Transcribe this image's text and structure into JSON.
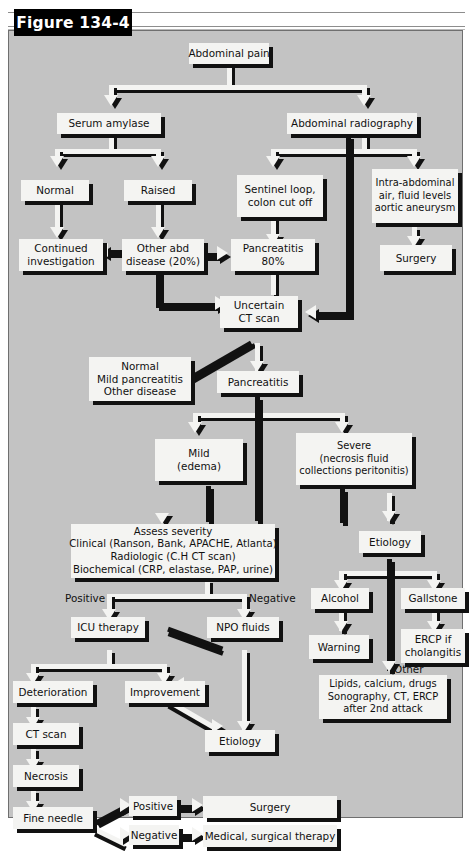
{
  "figure": {
    "banner_label": "Figure 134-4",
    "panel_background": "#c3c3c3",
    "box_fill": "#f4f4f2",
    "shadow_color": "#111111"
  },
  "diagram": {
    "type": "flowchart",
    "title": "Figure 134-4",
    "topic": "Diagnostic and management algorithm for abdominal pain and acute pancreatitis",
    "nodes": [
      {
        "id": "abdominal-pain",
        "label": "Abdominal pain"
      },
      {
        "id": "serum-amylase",
        "label": "Serum amylase"
      },
      {
        "id": "abdominal-radiography",
        "label": "Abdominal radiography"
      },
      {
        "id": "normal",
        "label": "Normal"
      },
      {
        "id": "raised",
        "label": "Raised"
      },
      {
        "id": "sentinel-loop",
        "label": "Sentinel loop,\ncolon cut off"
      },
      {
        "id": "intra-abdominal-air",
        "label": "Intra-abdominal\nair, fluid levels\naortic aneurysm"
      },
      {
        "id": "continued-investigation",
        "label": "Continued\ninvestigation"
      },
      {
        "id": "other-abd-disease",
        "label": "Other abd\ndisease (20%)"
      },
      {
        "id": "pancreatitis-80",
        "label": "Pancreatitis\n80%"
      },
      {
        "id": "surgery-top",
        "label": "Surgery"
      },
      {
        "id": "uncertain-ct-scan",
        "label": "Uncertain\nCT scan"
      },
      {
        "id": "normal-mild-other",
        "label": "Normal\nMild pancreatitis\nOther disease"
      },
      {
        "id": "pancreatitis",
        "label": "Pancreatitis"
      },
      {
        "id": "mild-edema",
        "label": "Mild\n(edema)"
      },
      {
        "id": "severe",
        "label": "Severe\n(necrosis fluid\ncollections peritonitis)"
      },
      {
        "id": "assess-severity",
        "label": "Assess severity\nClinical (Ranson, Bank, APACHE, Atlanta)\nRadiologic (C.H CT scan)\nBiochemical (CRP, elastase, PAP, urine)"
      },
      {
        "id": "etiology-right",
        "label": "Etiology"
      },
      {
        "id": "alcohol",
        "label": "Alcohol"
      },
      {
        "id": "gallstone",
        "label": "Gallstone"
      },
      {
        "id": "warning",
        "label": "Warning"
      },
      {
        "id": "ercp-if-cholangitis",
        "label": "ERCP if\ncholangitis"
      },
      {
        "id": "lipids-calcium-drugs",
        "label": "Lipids, calcium, drugs\nSonography, CT, ERCP\nafter 2nd attack"
      },
      {
        "id": "icu-therapy",
        "label": "ICU therapy"
      },
      {
        "id": "npo-fluids",
        "label": "NPO fluids"
      },
      {
        "id": "deterioration",
        "label": "Deterioration"
      },
      {
        "id": "improvement",
        "label": "Improvement"
      },
      {
        "id": "etiology-bottom",
        "label": "Etiology"
      },
      {
        "id": "ct-scan",
        "label": "CT scan"
      },
      {
        "id": "necrosis",
        "label": "Necrosis"
      },
      {
        "id": "fine-needle",
        "label": "Fine needle"
      },
      {
        "id": "surgery-bottom",
        "label": "Surgery"
      },
      {
        "id": "medical-surgical",
        "label": "Medical, surgical therapy"
      }
    ],
    "edge_labels": [
      {
        "id": "positive-severity",
        "label": "Positive"
      },
      {
        "id": "negative-severity",
        "label": "Negative"
      },
      {
        "id": "other-etiology",
        "label": "Other"
      },
      {
        "id": "positive-needle",
        "label": "Positive"
      },
      {
        "id": "negative-needle",
        "label": "Negative"
      }
    ]
  }
}
